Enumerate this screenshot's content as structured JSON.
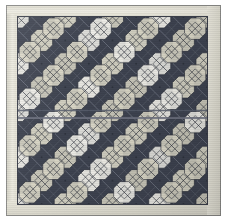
{
  "image": {
    "kind": "photograph",
    "subject": "patchwork quilt",
    "width": 227,
    "height": 221,
    "alt_text": "Photograph of a square patchwork quilt with a pale cream border surrounding a dark navy field of on-point snowball blocks quilted with X crosses"
  },
  "frame": {
    "outline_color": "#8d8d8a",
    "background_color": "#ffffff"
  },
  "quilt": {
    "border": {
      "label": "outer cream border",
      "color": "#e6e4d8",
      "shadow_color": "#d6d4c8",
      "width_px": 11
    },
    "field": {
      "label": "pieced centre field",
      "background_color": "#3e4350",
      "outline_color": "#3b3f4a",
      "left": 18,
      "top": 17,
      "width": 189,
      "height": 187,
      "columns": 8,
      "rows": 8,
      "cell_size": 23.6
    },
    "sashing": {
      "label": "horizontal centre sashing seam",
      "color": "#6e7280",
      "y": 117,
      "thickness": 2
    },
    "palette": {
      "dark_navy": "#3e4350",
      "mid_slate": "#565c6b",
      "light_cream": "#d9d6c6",
      "bright_white": "#f1f0ea",
      "seam_line": "#7a7f8c",
      "shadow": "#2b2f39"
    },
    "motif": {
      "name": "snowball-with-x-quilting",
      "description": "octagonal snowball patches set on point, each quilted with an X and an inner square",
      "alternating_fabrics": [
        "light_cream",
        "bright_white"
      ]
    }
  }
}
